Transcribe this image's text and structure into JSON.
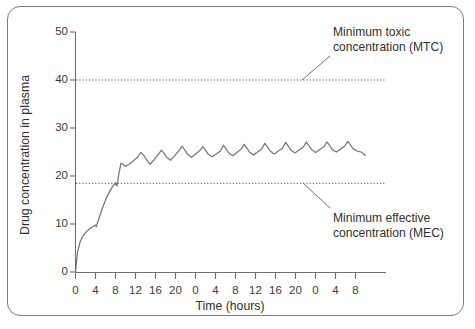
{
  "figure": {
    "border_color": "#7c7c7c",
    "background": "#ffffff"
  },
  "chart_data": {
    "type": "line",
    "title": "",
    "xlabel": "Time (hours)",
    "ylabel": "Drug concentration in plasma",
    "xlim": [
      0,
      60
    ],
    "ylim": [
      0,
      50
    ],
    "grid": false,
    "legend_position": "none",
    "x_tick_values": [
      0,
      4,
      8,
      12,
      16,
      20,
      24,
      28,
      32,
      36,
      40,
      44,
      48,
      52,
      56
    ],
    "x_tick_labels": [
      "0",
      "4",
      "8",
      "12",
      "16",
      "20",
      "0",
      "4",
      "8",
      "12",
      "16",
      "20",
      "0",
      "4",
      "8"
    ],
    "y_tick_values": [
      0,
      10,
      20,
      30,
      40,
      50
    ],
    "y_tick_labels": [
      "0",
      "10",
      "20",
      "30",
      "40",
      "50"
    ],
    "series": [
      {
        "name": "Plasma drug concentration",
        "color": "#777777",
        "x": [
          0,
          0.4,
          0.9,
          1.5,
          2.2,
          3.0,
          3.9,
          4.0,
          4.6,
          5.3,
          6.0,
          6.7,
          7.3,
          7.8,
          8.0,
          8.4,
          8.8,
          9.2,
          9.6,
          10.4,
          11.2,
          12.0,
          12.6,
          13.2,
          13.6,
          14.4,
          15.2,
          16.0,
          16.6,
          17.2,
          17.6,
          18.4,
          19.2,
          20.0,
          20.6,
          21.2,
          21.6,
          22.4,
          23.2,
          24.0,
          24.6,
          25.2,
          25.6,
          26.4,
          27.2,
          28.0,
          28.6,
          29.2,
          29.6,
          30.4,
          31.2,
          32.0,
          32.6,
          33.2,
          33.6,
          34.4,
          35.2,
          36.0,
          36.6,
          37.2,
          37.6,
          38.4,
          39.2,
          40.0,
          40.6,
          41.2,
          41.6,
          42.4,
          43.2,
          44.0,
          44.6,
          45.2,
          45.6,
          46.4,
          47.2,
          48.0,
          48.6,
          49.2,
          49.6,
          50.4,
          51.2,
          52.0,
          52.6,
          53.2,
          53.6,
          54.4,
          55.2,
          56.0
        ],
        "y": [
          0.0,
          4.2,
          6.3,
          7.6,
          8.5,
          9.2,
          9.8,
          9.4,
          11.4,
          13.6,
          15.5,
          17.0,
          18.0,
          18.6,
          17.9,
          20.6,
          22.7,
          22.4,
          22.0,
          22.5,
          23.2,
          23.9,
          24.9,
          24.3,
          23.6,
          22.4,
          23.4,
          24.5,
          25.4,
          24.6,
          23.9,
          23.3,
          24.3,
          25.3,
          26.2,
          25.3,
          24.6,
          23.9,
          24.6,
          25.3,
          26.1,
          25.3,
          24.6,
          24.0,
          24.6,
          25.2,
          26.4,
          25.5,
          24.8,
          24.2,
          24.9,
          25.6,
          26.6,
          25.7,
          25.0,
          24.4,
          25.0,
          25.7,
          26.8,
          25.9,
          25.2,
          24.6,
          25.2,
          25.8,
          27.0,
          26.1,
          25.4,
          24.8,
          25.4,
          26.0,
          27.1,
          26.2,
          25.5,
          24.9,
          25.5,
          26.1,
          27.1,
          26.2,
          25.5,
          25.0,
          25.6,
          26.2,
          27.2,
          26.4,
          25.7,
          25.2,
          25.0,
          24.3
        ]
      }
    ],
    "threshold_lines": [
      {
        "name": "MTC",
        "value": 40,
        "style": "dotted",
        "label": "Minimum toxic concentration (MTC)",
        "label_line_1": "Minimum toxic",
        "label_line_2": "concentration (MTC)"
      },
      {
        "name": "MEC",
        "value": 18.5,
        "style": "dotted",
        "label": "Minimum effective concentration (MEC)",
        "label_line_1": "Minimum effective",
        "label_line_2": "concentration (MEC)"
      }
    ]
  },
  "annotations": {
    "mtc": {
      "line1": "Minimum toxic",
      "line2": "concentration (MTC)"
    },
    "mec": {
      "line1": "Minimum effective",
      "line2": "concentration (MEC)"
    }
  },
  "axes": {
    "x_title": "Time (hours)",
    "y_title": "Drug concentration in plasma"
  }
}
